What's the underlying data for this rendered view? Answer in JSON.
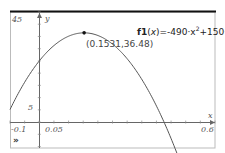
{
  "chart_data": {
    "type": "line",
    "title": "",
    "function_label": "f1(x)=-490·x²+150·x+25",
    "function_name": "f1",
    "function_arg": "x",
    "function_expr": "=-490·x²+150·x+25",
    "xlabel": "x",
    "ylabel": "y",
    "xlim": [
      -0.1,
      0.6
    ],
    "ylim": [
      -10.6,
      45
    ],
    "x_tick_labels": [
      "-0.1",
      "0.05",
      "0.6"
    ],
    "y_tick_labels": [
      "45",
      "5"
    ],
    "grid": false,
    "series": [
      {
        "name": "f1",
        "coefficients": {
          "a": -490,
          "b": 150,
          "c": 25
        },
        "color": "#555555"
      }
    ],
    "annotations": [
      {
        "type": "point",
        "x": 0.1531,
        "y": 36.48,
        "label": "(0.1531,36.48)"
      }
    ]
  },
  "ui": {
    "x_min_label": "-0.1",
    "x_tick_label": "0.05",
    "x_max_label": "0.6",
    "y_max_label": "45",
    "y_tick_label": "5",
    "x_axis_name": "x",
    "y_axis_name": "y",
    "fn_name": "f1",
    "fn_open": "(",
    "fn_arg": "x",
    "fn_close": ")",
    "fn_expr": "=-490·x",
    "fn_exp": "2",
    "fn_tail": "+150·x+25",
    "point_label": "(0.1531,36.48)",
    "menu_icon": "»"
  }
}
